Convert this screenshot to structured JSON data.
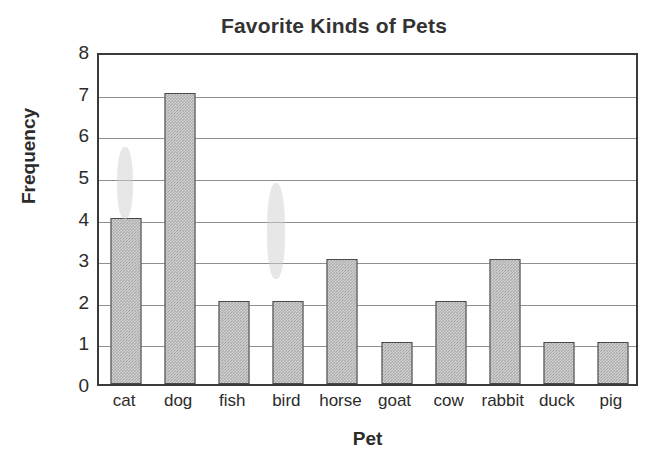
{
  "chart_data": {
    "type": "bar",
    "title": "Favorite Kinds of Pets",
    "xlabel": "Pet",
    "ylabel": "Frequency",
    "categories": [
      "cat",
      "dog",
      "fish",
      "bird",
      "horse",
      "goat",
      "cow",
      "rabbit",
      "duck",
      "pig"
    ],
    "values": [
      4,
      7,
      2,
      2,
      3,
      1,
      2,
      3,
      1,
      1
    ],
    "yticks": [
      0,
      1,
      2,
      3,
      4,
      5,
      6,
      7,
      8
    ],
    "ylim": [
      0,
      8
    ],
    "grid": true,
    "legend": false,
    "colors": {
      "bar_fill": "#acacac",
      "bar_edge": "#4a4a4a",
      "frame": "#3a3a3a",
      "gridline": "#8f8f8f",
      "title_text": "#333333",
      "axis_text": "#2b2b2b",
      "background": "#ffffff"
    }
  }
}
